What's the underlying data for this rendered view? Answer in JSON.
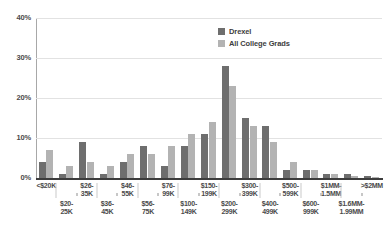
{
  "chart_data": {
    "type": "bar",
    "title": "",
    "subtitle": "",
    "xlabel": "",
    "ylabel": "",
    "ylim": [
      0,
      40
    ],
    "yunit": "%",
    "grid": true,
    "legend_position": "top-right",
    "y_ticks": [
      {
        "value": 0,
        "label": "0%"
      },
      {
        "value": 10,
        "label": "10%"
      },
      {
        "value": 20,
        "label": "20%"
      },
      {
        "value": 30,
        "label": "30%"
      },
      {
        "value": 40,
        "label": "40%"
      }
    ],
    "categories": [
      "<$20K",
      "$20-25K",
      "$26-35K",
      "$36-45K",
      "$46-55K",
      "$56-75K",
      "$76-99K",
      "$100-149K",
      "$150-199K",
      "$200-299K",
      "$300-399K",
      "$400-499K",
      "$500-599K",
      "$600-999K",
      "$1MM-1.5MM",
      "$1.6MM-1.99MM",
      ">$2MM"
    ],
    "category_labels_two_row": [
      {
        "row": "top",
        "line1": "<$20K",
        "line2": ""
      },
      {
        "row": "bot",
        "line1": "$20-",
        "line2": "25K"
      },
      {
        "row": "top",
        "line1": "$26-",
        "line2": "35K"
      },
      {
        "row": "bot",
        "line1": "$36-",
        "line2": "45K"
      },
      {
        "row": "top",
        "line1": "$46-",
        "line2": "55K"
      },
      {
        "row": "bot",
        "line1": "$56-",
        "line2": "75K"
      },
      {
        "row": "top",
        "line1": "$76-",
        "line2": "99K"
      },
      {
        "row": "bot",
        "line1": "$100-",
        "line2": "149K"
      },
      {
        "row": "top",
        "line1": "$150-",
        "line2": "199K"
      },
      {
        "row": "bot",
        "line1": "$200-",
        "line2": "299K"
      },
      {
        "row": "top",
        "line1": "$300-",
        "line2": "399K"
      },
      {
        "row": "bot",
        "line1": "$400-",
        "line2": "499K"
      },
      {
        "row": "top",
        "line1": "$500-",
        "line2": "599K"
      },
      {
        "row": "bot",
        "line1": "$600-",
        "line2": "999K"
      },
      {
        "row": "top",
        "line1": "$1MM-",
        "line2": "1.5MM"
      },
      {
        "row": "bot",
        "line1": "$1.6MM-",
        "line2": "1.99MM"
      },
      {
        "row": "top",
        "line1": ">$2MM",
        "line2": ""
      }
    ],
    "series": [
      {
        "name": "Drexel",
        "color": "#6e6e6e",
        "values": [
          4,
          1,
          9,
          1,
          4,
          8,
          3,
          8,
          11,
          28,
          15,
          13,
          2,
          2,
          1,
          1,
          0.5
        ]
      },
      {
        "name": "All College Grads",
        "color": "#b3b3b3",
        "values": [
          7,
          3,
          4,
          3,
          6,
          6,
          8,
          11,
          14,
          23,
          13,
          9,
          4,
          2,
          1,
          0.5,
          0.3
        ]
      }
    ]
  },
  "legend": {
    "items": [
      {
        "label": "Drexel",
        "color": "#6e6e6e"
      },
      {
        "label": "All College Grads",
        "color": "#b3b3b3"
      }
    ]
  },
  "colors": {
    "series_drexel": "#6e6e6e",
    "series_all_grads": "#b3b3b3",
    "gridline": "#e2e2e2",
    "axis": "#3d3d3d",
    "text": "#4a4a4a",
    "background": "#ffffff"
  }
}
